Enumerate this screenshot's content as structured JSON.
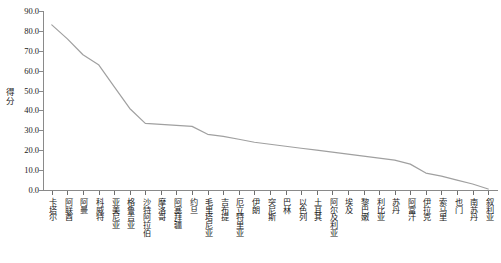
{
  "chart_data": {
    "type": "line",
    "title": "",
    "xlabel": "",
    "ylabel": "得分",
    "ylim": [
      0.0,
      90.0
    ],
    "yticks": [
      "0.0",
      "10.0",
      "20.0",
      "30.0",
      "40.0",
      "50.0",
      "60.0",
      "70.0",
      "80.0",
      "90.0"
    ],
    "ytick_values": [
      0,
      10,
      20,
      30,
      40,
      50,
      60,
      70,
      80,
      90
    ],
    "grid": false,
    "legend": "none",
    "line_color": "#a0a0a0",
    "categories": [
      "卡塔尔",
      "阿联酋",
      "阿曼",
      "科威特",
      "亚美尼亚",
      "格鲁吉亚",
      "沙特阿拉伯",
      "摩洛哥",
      "阿塞拜疆",
      "约旦",
      "毛里塔尼亚",
      "吉布提",
      "厄立特里亚",
      "伊朗",
      "突尼斯",
      "巴林",
      "以色列",
      "土耳其",
      "阿尔及利亚",
      "埃及",
      "黎巴嫩",
      "利比亚",
      "苏丹",
      "阿富汗",
      "伊拉克",
      "索马里",
      "也门",
      "南苏丹",
      "叙利亚"
    ],
    "values": [
      83.0,
      76.0,
      68.0,
      63.0,
      52.0,
      41.0,
      33.5,
      33.0,
      32.5,
      32.0,
      28.0,
      27.0,
      25.5,
      24.0,
      23.0,
      22.0,
      21.0,
      20.0,
      19.0,
      18.0,
      17.0,
      16.0,
      15.0,
      13.0,
      8.5,
      7.0,
      5.0,
      3.0,
      0.5
    ]
  }
}
